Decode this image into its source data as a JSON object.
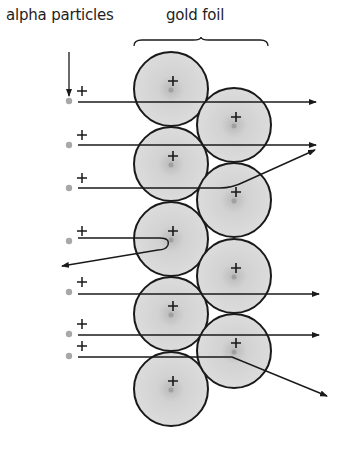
{
  "labels": {
    "alpha_particles": "alpha particles",
    "gold_foil": "gold foil"
  },
  "colors": {
    "stroke": "#1a1a1a",
    "atom_fill": "#dcdcdc",
    "atom_center": "#b9b9b9",
    "particle": "#a8a8a8",
    "background": "#ffffff"
  },
  "atoms": [
    {
      "cx": 171,
      "cy": 89,
      "r": 37
    },
    {
      "cx": 171,
      "cy": 164,
      "r": 37
    },
    {
      "cx": 171,
      "cy": 239,
      "r": 37
    },
    {
      "cx": 171,
      "cy": 314,
      "r": 37
    },
    {
      "cx": 171,
      "cy": 389,
      "r": 37
    },
    {
      "cx": 234,
      "cy": 125,
      "r": 37
    },
    {
      "cx": 234,
      "cy": 200,
      "r": 37
    },
    {
      "cx": 234,
      "cy": 276,
      "r": 37
    },
    {
      "cx": 234,
      "cy": 351,
      "r": 37
    }
  ],
  "particles": [
    {
      "x": 69,
      "y": 101,
      "path": "M 78 102 L 316 102",
      "deflection": "none"
    },
    {
      "x": 69,
      "y": 145,
      "path": "M 78 145 L 316 145",
      "deflection": "none"
    },
    {
      "x": 69,
      "y": 188,
      "path": "M 78 188 L 220 188 Q 232 188 244 182 L 315 150",
      "deflection": "small"
    },
    {
      "x": 69,
      "y": 241,
      "path": "M 78 238 L 160 238 Q 170 238 168 245 Q 166 250 158 250 L 62 266",
      "deflection": "backscatter"
    },
    {
      "x": 69,
      "y": 292,
      "path": "M 78 294 L 319 294",
      "deflection": "none"
    },
    {
      "x": 69,
      "y": 334,
      "path": "M 78 335 L 319 335",
      "deflection": "none"
    },
    {
      "x": 69,
      "y": 356,
      "path": "M 78 357 L 232 357 L 327 396",
      "deflection": "large"
    }
  ],
  "source_arrow": {
    "x": 69,
    "y1": 52,
    "y2": 96
  },
  "brace": {
    "x1": 134,
    "x2": 268,
    "y": 46,
    "peak_x": 201,
    "peak_y": 37
  }
}
